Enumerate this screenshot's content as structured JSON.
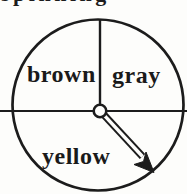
{
  "caption_fragment": "spinning",
  "spinner": {
    "labels": {
      "top_left": "brown",
      "top_right": "gray",
      "bottom": "yellow"
    },
    "sections": [
      {
        "label": "brown",
        "fraction": "1/4",
        "position": "top-left quarter"
      },
      {
        "label": "gray",
        "fraction": "1/4",
        "position": "top-right quarter"
      },
      {
        "label": "yellow",
        "fraction": "1/2",
        "position": "bottom half"
      }
    ],
    "pointer": {
      "style": "outlined arrow with solid barbed head",
      "origin": "center hub",
      "direction": "down-right"
    },
    "colors": {
      "ink": "#1c1c1c",
      "background": "#fdfdfb"
    }
  }
}
